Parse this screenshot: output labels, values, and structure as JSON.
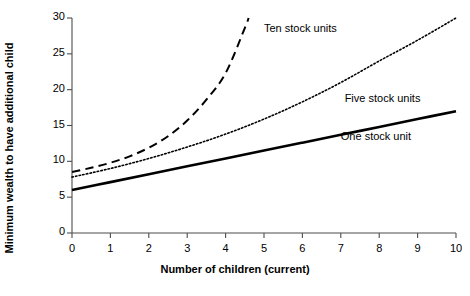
{
  "chart_data": {
    "type": "line",
    "title": "",
    "xlabel": "Number of children (current)",
    "ylabel": "Minimum wealth to have additional child",
    "xlim": [
      0,
      10
    ],
    "ylim": [
      0,
      30
    ],
    "xticks": [
      0,
      1,
      2,
      3,
      4,
      5,
      6,
      7,
      8,
      9,
      10
    ],
    "xtick_labels": [
      "0",
      "1",
      "2",
      "3",
      "4",
      "5",
      "6",
      "7",
      "8",
      "9",
      "10"
    ],
    "yticks": [
      0,
      5,
      10,
      15,
      20,
      25,
      30
    ],
    "ytick_labels": [
      "0",
      "5",
      "10",
      "15",
      "20",
      "25",
      "30"
    ],
    "grid": false,
    "legend_position": "inline-annotations",
    "series": [
      {
        "name": "One stock unit",
        "style": "solid",
        "color": "#000000",
        "width": 2.6,
        "label_x": 7.0,
        "label_y": 13.3,
        "x": [
          0,
          1,
          2,
          3,
          4,
          5,
          6,
          7,
          8,
          9,
          10
        ],
        "values": [
          6.0,
          7.1,
          8.2,
          9.3,
          10.4,
          11.5,
          12.6,
          13.7,
          14.8,
          15.9,
          17.0
        ]
      },
      {
        "name": "Five stock units",
        "style": "dotted",
        "color": "#000000",
        "width": 1.6,
        "label_x": 7.1,
        "label_y": 18.6,
        "x": [
          0,
          1,
          2,
          3,
          4,
          5,
          6,
          7,
          8,
          9,
          10
        ],
        "values": [
          7.8,
          9.0,
          10.4,
          12.0,
          13.8,
          15.9,
          18.3,
          21.0,
          24.0,
          26.9,
          30.0
        ]
      },
      {
        "name": "Ten stock units",
        "style": "dashed",
        "color": "#000000",
        "width": 2.0,
        "label_x": 5.0,
        "label_y": 28.3,
        "x": [
          0,
          0.5,
          1,
          1.5,
          2,
          2.5,
          3,
          3.5,
          4,
          4.5,
          4.6
        ],
        "values": [
          8.5,
          9.1,
          9.8,
          10.7,
          11.9,
          13.5,
          15.7,
          18.6,
          22.3,
          28.6,
          30.0
        ]
      }
    ]
  },
  "axes": {
    "x_title": "Number of children (current)",
    "y_title": "Minimum wealth to have additional child"
  },
  "annotations": {
    "ten_stock_units": "Ten stock units",
    "five_stock_units": "Five stock units",
    "one_stock_unit": "One stock unit"
  }
}
